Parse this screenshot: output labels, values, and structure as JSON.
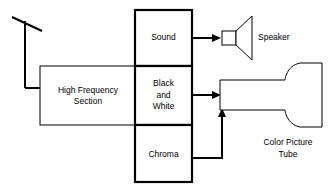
{
  "diagram": {
    "colors": {
      "stroke": "#000000",
      "background": "#ffffff",
      "text": "#000000"
    },
    "antenna": {
      "name": "antenna",
      "label": ""
    },
    "blocks": {
      "high_frequency": {
        "label_line1": "High Frequency",
        "label_line2": "Section"
      },
      "sound": {
        "label": "Sound"
      },
      "black_and_white": {
        "label_line1": "Black",
        "label_line2": "and",
        "label_line3": "White"
      },
      "chroma": {
        "label": "Chroma"
      }
    },
    "outputs": {
      "speaker": {
        "label": "Speaker"
      },
      "picture_tube": {
        "label_line1": "Color Picture",
        "label_line2": "Tube"
      }
    },
    "signal_paths": [
      {
        "name": "antenna-to-high-frequency",
        "from": "antenna",
        "to": "high_frequency"
      },
      {
        "name": "sound-to-speaker",
        "from": "sound",
        "to": "speaker"
      },
      {
        "name": "black-and-white-to-picture-tube",
        "from": "black_and_white",
        "to": "picture_tube"
      },
      {
        "name": "chroma-to-picture-tube",
        "from": "chroma",
        "to": "picture_tube"
      }
    ]
  }
}
